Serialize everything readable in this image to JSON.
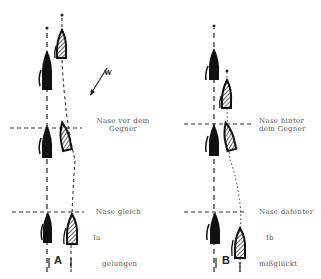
{
  "diagram": {
    "type": "sailing-maneuver-comparison",
    "wind_label": "w",
    "panel_a": {
      "id": "A",
      "case": "Ia",
      "result": "gelungen",
      "lines": [
        {
          "label": "Nase vor dem\nGegner",
          "label_l1": "Nase vor dem",
          "label_l2": "Gegner"
        },
        {
          "label": "Nase gleich"
        }
      ]
    },
    "panel_b": {
      "id": "B",
      "case": "Ib",
      "result": "mißglückt",
      "lines": [
        {
          "label_l1": "Nase hinter",
          "label_l2": "dem Gegner"
        },
        {
          "label": "Nase dahinter"
        }
      ]
    },
    "colors": {
      "ink": "#1a1a1a",
      "line": "#333333",
      "text": "#555555"
    }
  }
}
